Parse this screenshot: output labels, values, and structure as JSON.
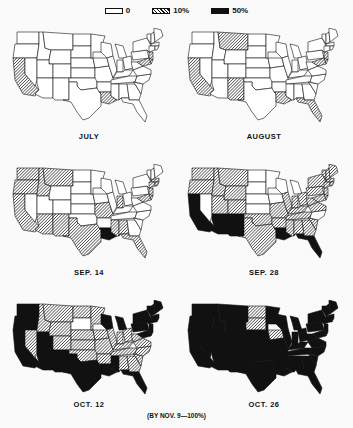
{
  "legend": [
    {
      "key": "none",
      "label": "0"
    },
    {
      "key": "ten",
      "label": "10%"
    },
    {
      "key": "fifty",
      "label": "50%"
    }
  ],
  "colors": {
    "none": "#ffffff",
    "fifty": "#111111",
    "outline": "#111111"
  },
  "footnote": "(BY NOV. 9—100%)",
  "maps": [
    {
      "caption": "JULY",
      "fifty": [],
      "ten": [
        "CA",
        "LA",
        "NJ",
        "DE",
        "MD"
      ]
    },
    {
      "caption": "AUGUST",
      "fifty": [],
      "ten": [
        "CA",
        "MT",
        "NM",
        "LA",
        "FL",
        "NJ",
        "DE",
        "MD"
      ]
    },
    {
      "caption": "SEP. 14",
      "fifty": [
        "LA"
      ],
      "ten": [
        "WA",
        "OR",
        "CA",
        "ID",
        "MT",
        "AZ",
        "NM",
        "TX",
        "MO",
        "IN",
        "MS",
        "AL",
        "FL",
        "NJ",
        "DE",
        "MD",
        "MA",
        "CT",
        "RI"
      ]
    },
    {
      "caption": "SEP. 28",
      "fifty": [
        "CA",
        "AZ",
        "NM",
        "LA",
        "FL"
      ],
      "ten": [
        "WA",
        "OR",
        "ID",
        "MT",
        "WY",
        "UT",
        "CO",
        "TX",
        "OK",
        "AR",
        "MO",
        "IL",
        "IN",
        "OH",
        "KY",
        "TN",
        "MS",
        "AL",
        "GA",
        "SC",
        "PA",
        "NY",
        "NJ",
        "DE",
        "MD",
        "VA",
        "WV",
        "VT",
        "NH",
        "ME",
        "MA",
        "CT",
        "RI"
      ]
    },
    {
      "caption": "OCT. 12",
      "fifty": [
        "WA",
        "OR",
        "CA",
        "AZ",
        "NM",
        "TX",
        "LA",
        "MS",
        "FL",
        "MI",
        "WI",
        "NY",
        "PA",
        "NJ",
        "DE",
        "MD",
        "VT",
        "NH",
        "ME",
        "MA",
        "CT",
        "RI",
        "UT"
      ],
      "ten": [
        "ID",
        "MT",
        "WY",
        "CO",
        "NV",
        "ND",
        "NE",
        "KS",
        "OK",
        "MN",
        "IA",
        "MO",
        "AR",
        "IL",
        "IN",
        "OH",
        "KY",
        "TN",
        "AL",
        "GA",
        "SC",
        "NC",
        "VA",
        "WV"
      ]
    },
    {
      "caption": "OCT. 26",
      "fifty": [
        "WA",
        "OR",
        "CA",
        "NV",
        "ID",
        "MT",
        "WY",
        "UT",
        "CO",
        "AZ",
        "NM",
        "TX",
        "OK",
        "KS",
        "NE",
        "MN",
        "MO",
        "AR",
        "LA",
        "WI",
        "IL",
        "MI",
        "IN",
        "OH",
        "KY",
        "TN",
        "MS",
        "AL",
        "GA",
        "FL",
        "SC",
        "NC",
        "VA",
        "WV",
        "PA",
        "NY",
        "NJ",
        "DE",
        "MD",
        "VT",
        "NH",
        "ME",
        "MA",
        "CT",
        "RI"
      ],
      "ten": [
        "ND",
        "SD",
        "IA"
      ]
    }
  ]
}
